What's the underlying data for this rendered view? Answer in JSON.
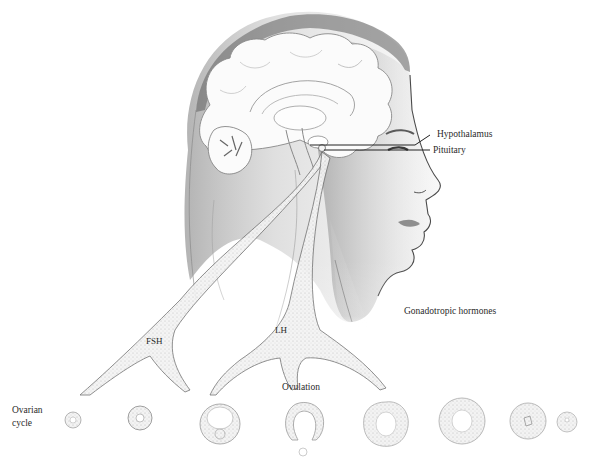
{
  "figure": {
    "colors": {
      "background": "#ffffff",
      "ink": "#2a2a2a",
      "shade_dark": "#6e6e6e",
      "shade_mid": "#a9a9a9",
      "shade_light": "#d9d9d9",
      "brain": "#fbfbfb"
    }
  },
  "labels": {
    "hypothalamus": "Hypothalamus",
    "pituitary": "Pituitary",
    "gonadotropic": "Gonadotropic hormones",
    "fsh": "FSH",
    "lh": "LH",
    "ovulation": "Ovulation",
    "ovarian_line1": "Ovarian",
    "ovarian_line2": "cycle"
  },
  "ovarian_stages": [
    {
      "stage": "primordial follicle",
      "x": 73,
      "y": 420,
      "r": 8
    },
    {
      "stage": "primary follicle",
      "x": 140,
      "y": 418,
      "r": 12
    },
    {
      "stage": "antral follicle",
      "x": 220,
      "y": 424,
      "r": 20
    },
    {
      "stage": "ruptured follicle (ovulation)",
      "x": 304,
      "y": 425,
      "r": 20
    },
    {
      "stage": "early corpus luteum",
      "x": 386,
      "y": 424,
      "r": 22
    },
    {
      "stage": "corpus luteum",
      "x": 462,
      "y": 421,
      "r": 23
    },
    {
      "stage": "regressing corpus luteum",
      "x": 528,
      "y": 421,
      "r": 18
    },
    {
      "stage": "corpus albicans",
      "x": 567,
      "y": 422,
      "r": 10
    }
  ]
}
